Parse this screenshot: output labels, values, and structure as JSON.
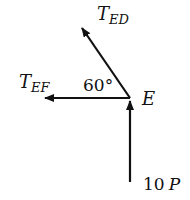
{
  "diagram": {
    "type": "free-body-diagram",
    "node": {
      "label": "E"
    },
    "forces": [
      {
        "id": "ted",
        "symbol": "T",
        "subscript": "ED",
        "direction": "up-left, 60° from horizontal"
      },
      {
        "id": "tef",
        "symbol": "T",
        "subscript": "EF",
        "direction": "left"
      },
      {
        "id": "load",
        "label": "10 P",
        "direction": "up"
      }
    ],
    "angle": {
      "value": "60°"
    }
  },
  "labels": {
    "ted_T": "T",
    "ted_sub": "ED",
    "tef_T": "T",
    "tef_sub": "EF",
    "node": "E",
    "angle": "60°",
    "load_num": "10",
    "load_P": "P"
  },
  "colors": {
    "ink": "#111111",
    "background": "#ffffff"
  }
}
